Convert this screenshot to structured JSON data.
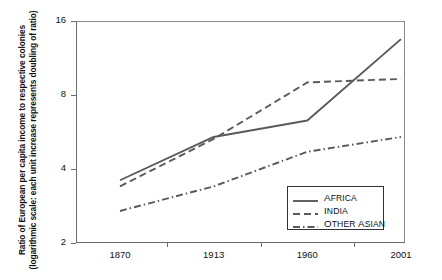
{
  "chart_data": {
    "type": "line",
    "title": "",
    "xlabel": "",
    "ylabel": "Ratio of European per capita income to respective colonies (logarithmic scale: each unit increase represents doubling of ratio)",
    "categories": [
      "1870",
      "1913",
      "1960",
      "2001"
    ],
    "x": [
      1870,
      1913,
      1960,
      2001
    ],
    "yticks": [
      "2",
      "4",
      "8",
      "16"
    ],
    "ytick_values": [
      2,
      4,
      8,
      16
    ],
    "ylim": [
      2,
      16
    ],
    "yscale": "log2",
    "grid": false,
    "legend_position": "bottom-right",
    "series": [
      {
        "name": "Africa",
        "style": "solid",
        "color": "#5a5a5a",
        "values": [
          3.6,
          5.4,
          6.3,
          13.5
        ]
      },
      {
        "name": "India",
        "style": "dashed",
        "color": "#5a5a5a",
        "values": [
          3.4,
          5.3,
          9.0,
          9.3
        ]
      },
      {
        "name": "Other Asian",
        "style": "dashdot",
        "color": "#5a5a5a",
        "values": [
          2.7,
          3.4,
          4.7,
          5.4
        ]
      }
    ]
  },
  "legend": {
    "items": [
      {
        "label": "Africa",
        "first": "A",
        "rest": "FRICA"
      },
      {
        "label": "India",
        "first": "I",
        "rest": "NDIA"
      },
      {
        "label": "Other Asian",
        "first": "O",
        "rest": "THER ",
        "first2": "A",
        "rest2": "SIAN"
      }
    ]
  },
  "colors": {
    "line": "#5a5a5a",
    "axis": "#6b6b6b",
    "frame": "#8a8a8a",
    "text": "#111111",
    "background": "#ffffff"
  }
}
